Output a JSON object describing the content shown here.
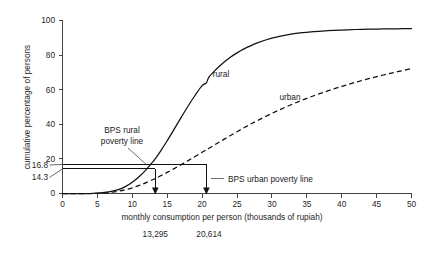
{
  "chart_data": {
    "type": "line",
    "title": "",
    "xlabel": "monthly consumption per person (thousands of rupiah)",
    "ylabel": "cumulative percentage of persons",
    "xlim": [
      0,
      50
    ],
    "ylim": [
      0,
      100
    ],
    "grid": false,
    "legend_position": "inline-curve-labels",
    "xticks": [
      "0",
      "5",
      "10",
      "15",
      "20",
      "25",
      "30",
      "35",
      "40",
      "45",
      "50"
    ],
    "xtick_values": [
      0,
      5,
      10,
      15,
      20,
      25,
      30,
      35,
      40,
      45,
      50
    ],
    "yticks": [
      "0",
      "20",
      "40",
      "60",
      "80",
      "100"
    ],
    "ytick_values": [
      0,
      20,
      40,
      60,
      80,
      100
    ],
    "y_callout_labels": [
      "16.8",
      "14.3"
    ],
    "y_callout_values": [
      16.8,
      14.3
    ],
    "x": [
      0,
      2,
      4,
      5,
      6,
      7,
      8,
      9,
      10,
      11,
      12,
      13,
      13.295,
      14,
      15,
      16,
      17,
      18,
      19,
      20,
      20.614,
      21,
      22,
      23,
      24,
      25,
      26,
      27,
      28,
      30,
      32,
      34,
      36,
      38,
      40,
      42,
      44,
      46,
      48,
      50
    ],
    "series": [
      {
        "name": "rural",
        "style": "solid",
        "values": [
          0,
          0,
          0,
          0.2,
          0.6,
          1.2,
          2.2,
          4.0,
          6.5,
          9.8,
          13.8,
          18.6,
          20.1,
          24.2,
          30.5,
          37.2,
          44.0,
          50.6,
          56.8,
          62.4,
          64.0,
          67.4,
          71.7,
          75.4,
          78.6,
          81.3,
          83.6,
          85.5,
          87.2,
          89.8,
          91.6,
          92.8,
          93.6,
          94.1,
          94.5,
          94.8,
          95.0,
          95.1,
          95.2,
          95.3
        ]
      },
      {
        "name": "urban",
        "style": "dashed",
        "values": [
          0,
          0,
          0,
          0.1,
          0.3,
          0.7,
          1.3,
          2.2,
          3.3,
          4.7,
          6.3,
          8.1,
          8.6,
          10.1,
          12.2,
          14.4,
          16.7,
          19.0,
          21.4,
          23.8,
          25.3,
          26.2,
          28.6,
          31.0,
          33.4,
          35.7,
          38.0,
          40.2,
          42.3,
          46.3,
          50.0,
          53.4,
          56.5,
          59.3,
          61.9,
          64.3,
          66.5,
          68.5,
          70.4,
          72.2
        ]
      }
    ],
    "annotations": [
      {
        "name": "bps-rural-poverty-line",
        "lines": [
          "BPS rural",
          "poverty line"
        ],
        "target_y": 16.8
      },
      {
        "name": "bps-urban-poverty-line",
        "lines": [
          "BPS urban poverty line"
        ],
        "target_y": 16.8
      }
    ],
    "markers": [
      {
        "name": "rural-poverty-threshold",
        "label": "13,295",
        "x": 13.295,
        "y": 14.3
      },
      {
        "name": "urban-poverty-threshold",
        "label": "20,614",
        "x": 20.614,
        "y": 16.8
      }
    ]
  },
  "chart": {
    "curve_labels": {
      "rural": "rural",
      "urban": "urban"
    },
    "annotation_rural_line1": "BPS rural",
    "annotation_rural_line2": "poverty line",
    "annotation_urban": "BPS urban poverty line",
    "marker_label_rural": "13,295",
    "marker_label_urban": "20,614",
    "y_callout_upper": "16.8",
    "y_callout_lower": "14.3",
    "xlabel": "monthly consumption per person (thousands of rupiah)",
    "ylabel": "cumulative percentage of persons",
    "xtick_0": "0",
    "xtick_5": "5",
    "xtick_10": "10",
    "xtick_15": "15",
    "xtick_20": "20",
    "xtick_25": "25",
    "xtick_30": "30",
    "xtick_35": "35",
    "xtick_40": "40",
    "xtick_45": "45",
    "xtick_50": "50",
    "ytick_0": "0",
    "ytick_20": "20",
    "ytick_40": "40",
    "ytick_60": "60",
    "ytick_80": "80",
    "ytick_100": "100"
  }
}
